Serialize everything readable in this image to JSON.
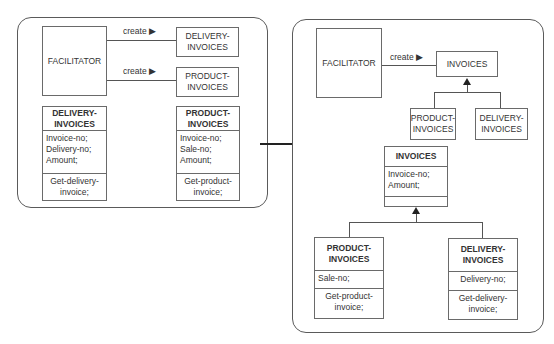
{
  "diagram": {
    "type": "uml-class-refactoring",
    "left_panel": {
      "facilitator": "FACILITATOR",
      "relations": [
        {
          "label": "create",
          "arrow_glyph": "▶",
          "target": "DELIVERY-\nINVOICES"
        },
        {
          "label": "create",
          "arrow_glyph": "▶",
          "target": "PRODUCT-\nINVOICES"
        }
      ],
      "target_delivery": {
        "line1": "DELIVERY-",
        "line2": "INVOICES"
      },
      "target_product": {
        "line1": "PRODUCT-",
        "line2": "INVOICES"
      },
      "classes": [
        {
          "name_line1": "DELIVERY-",
          "name_line2": "INVOICES",
          "attributes": [
            "Invoice-no;",
            "Delivery-no;",
            "Amount;"
          ],
          "methods": [
            "Get-delivery-",
            "invoice;"
          ]
        },
        {
          "name_line1": "PRODUCT-",
          "name_line2": "INVOICES",
          "attributes": [
            "Invoice-no;",
            "Sale-no;",
            "Amount;"
          ],
          "methods": [
            "Get-product-",
            "invoice;"
          ]
        }
      ]
    },
    "transition_arrow": "→",
    "right_panel": {
      "facilitator": "FACILITATOR",
      "relation": {
        "label": "create",
        "arrow_glyph": "▶",
        "target": "INVOICES"
      },
      "subclasses_small": [
        {
          "line1": "PRODUCT-",
          "line2": "INVOICES"
        },
        {
          "line1": "DELIVERY-",
          "line2": "INVOICES"
        }
      ],
      "superclass": {
        "name": "INVOICES",
        "attributes": [
          "Invoice-no;",
          "Amount;"
        ],
        "methods": []
      },
      "subclasses": [
        {
          "name_line1": "PRODUCT-",
          "name_line2": "INVOICES",
          "attributes": [
            "Sale-no;"
          ],
          "methods": [
            "Get-product-",
            "invoice;"
          ]
        },
        {
          "name_line1": "DELIVERY-",
          "name_line2": "INVOICES",
          "attributes": [
            "Delivery-no;"
          ],
          "methods": [
            "Get-delivery-",
            "invoice;"
          ]
        }
      ]
    }
  },
  "colors": {
    "line": "#555555",
    "box_border": "#6a6a6a",
    "text": "#333333",
    "background": "#ffffff"
  }
}
